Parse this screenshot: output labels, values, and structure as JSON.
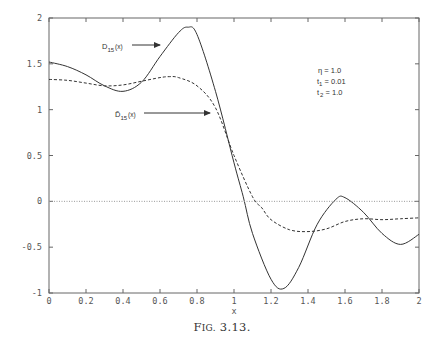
{
  "chart_data": {
    "type": "line",
    "title": "",
    "caption": "Fig. 3.13.",
    "xlabel": "x",
    "ylabel": "",
    "xlim": [
      0,
      2
    ],
    "ylim": [
      -1,
      2
    ],
    "grid": false,
    "legend_position": "none (inline arrow annotations)",
    "x_ticks": [
      "0",
      "0.2",
      "0.4",
      "0.6",
      "0.8",
      "1",
      "1.2",
      "1.4",
      "1.6",
      "1.8",
      "2"
    ],
    "y_ticks": [
      "-1",
      "-0.5",
      "0",
      "0.5",
      "1",
      "1.5",
      "2"
    ],
    "series": [
      {
        "name": "D_15(x)",
        "style": "solid",
        "x": [
          0,
          0.1,
          0.2,
          0.3,
          0.4,
          0.5,
          0.6,
          0.7,
          0.75,
          0.8,
          0.9,
          1.0,
          1.05,
          1.1,
          1.2,
          1.27,
          1.35,
          1.45,
          1.55,
          1.6,
          1.7,
          1.8,
          1.9,
          2.0
        ],
        "y": [
          1.52,
          1.47,
          1.38,
          1.26,
          1.2,
          1.3,
          1.58,
          1.84,
          1.9,
          1.82,
          1.2,
          0.42,
          0.05,
          -0.35,
          -0.85,
          -0.95,
          -0.72,
          -0.25,
          0.02,
          0.04,
          -0.12,
          -0.35,
          -0.47,
          -0.36
        ]
      },
      {
        "name": "D̃_15(x)",
        "style": "dashed",
        "x": [
          0,
          0.1,
          0.2,
          0.3,
          0.4,
          0.5,
          0.6,
          0.65,
          0.7,
          0.8,
          0.9,
          1.0,
          1.1,
          1.15,
          1.2,
          1.3,
          1.4,
          1.5,
          1.6,
          1.7,
          1.8,
          1.9,
          2.0
        ],
        "y": [
          1.33,
          1.32,
          1.29,
          1.26,
          1.27,
          1.31,
          1.35,
          1.36,
          1.35,
          1.26,
          1.02,
          0.5,
          0.05,
          -0.07,
          -0.2,
          -0.31,
          -0.33,
          -0.3,
          -0.22,
          -0.19,
          -0.2,
          -0.19,
          -0.18
        ]
      },
      {
        "name": "zero line",
        "style": "dotted",
        "x": [
          0,
          2
        ],
        "y": [
          0,
          0
        ]
      }
    ],
    "annotations": [
      {
        "text": "D_15(x)",
        "arrow_to": [
          0.72,
          1.8
        ]
      },
      {
        "text": "D̃_15(x)",
        "arrow_to": [
          0.9,
          0.95
        ]
      },
      {
        "text": "η = 1.0"
      },
      {
        "text": "t_1 = 0.01"
      },
      {
        "text": "t_2 = 1.0"
      }
    ]
  },
  "labels": {
    "x_axis": "x",
    "caption_big": "F",
    "caption_small": "IG.",
    "caption_num": " 3.13.",
    "curve1_main": "D",
    "curve1_sub": "15",
    "curve1_arg": "(x)",
    "curve2_main": "D̃",
    "curve2_sub": "15",
    "curve2_arg": "(x)",
    "param_eta": "η = 1.0",
    "param_t1_main": "t",
    "param_t1_sub": "1",
    "param_t1_val": " = 0.01",
    "param_t2_main": "t",
    "param_t2_sub": "2",
    "param_t2_val": " = 1.0"
  },
  "colors": {
    "axis": "#666666",
    "curve": "#333333",
    "zero_line": "#999999"
  }
}
